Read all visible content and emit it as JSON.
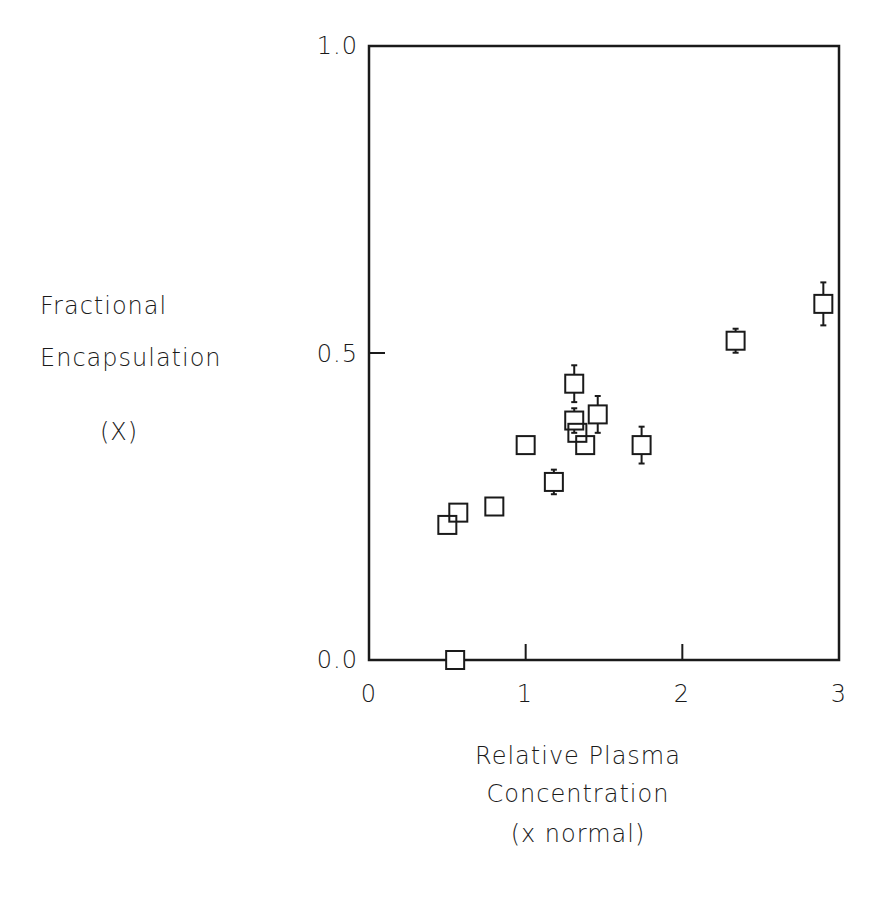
{
  "chart_data": {
    "type": "scatter",
    "title": "",
    "ylabel_lines": [
      "Fractional",
      "Encapsulation",
      "(X)"
    ],
    "xlabel_lines": [
      "Relative Plasma",
      "Concentration",
      "(x normal)"
    ],
    "xlim": [
      0,
      3
    ],
    "ylim": [
      0.0,
      1.0
    ],
    "x_ticks": [
      "0",
      "1",
      "2",
      "3"
    ],
    "y_ticks": [
      "0.0",
      "0.5",
      "1.0"
    ],
    "grid": false,
    "marker": "open-square",
    "points": [
      {
        "x": 0.5,
        "y": 0.22,
        "err": 0
      },
      {
        "x": 0.57,
        "y": 0.24,
        "err": 0
      },
      {
        "x": 0.55,
        "y": 0.0,
        "err": 0
      },
      {
        "x": 0.8,
        "y": 0.25,
        "err": 0
      },
      {
        "x": 1.0,
        "y": 0.35,
        "err": 0
      },
      {
        "x": 1.18,
        "y": 0.29,
        "err": 0.02
      },
      {
        "x": 1.31,
        "y": 0.45,
        "err": 0.03
      },
      {
        "x": 1.31,
        "y": 0.39,
        "err": 0.02
      },
      {
        "x": 1.33,
        "y": 0.37,
        "err": 0
      },
      {
        "x": 1.38,
        "y": 0.35,
        "err": 0
      },
      {
        "x": 1.46,
        "y": 0.4,
        "err": 0.03
      },
      {
        "x": 1.74,
        "y": 0.35,
        "err": 0.03
      },
      {
        "x": 2.34,
        "y": 0.52,
        "err": 0.015
      },
      {
        "x": 2.9,
        "y": 0.58,
        "err": 0.035
      }
    ]
  }
}
